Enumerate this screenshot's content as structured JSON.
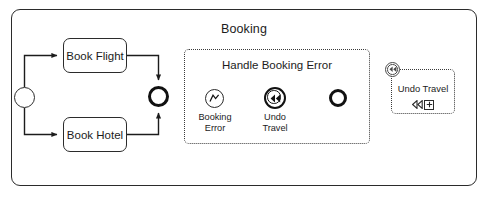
{
  "process": {
    "title": "Booking",
    "frame_style": "rounded-solid"
  },
  "tasks": [
    {
      "id": "book-flight",
      "label": "Book Flight"
    },
    {
      "id": "book-hotel",
      "label": "Book Hotel"
    }
  ],
  "events": [
    {
      "id": "start-event",
      "label": "",
      "kind": "start-event",
      "symbol": "none"
    },
    {
      "id": "merge-event",
      "label": "",
      "kind": "end-event",
      "symbol": "none"
    }
  ],
  "event_subprocess": {
    "title": "Handle Booking Error",
    "border": "dotted",
    "nodes": [
      {
        "id": "error-event",
        "label": "Booking\nError",
        "kind": "error-start-event",
        "symbol": "error-bolt-icon"
      },
      {
        "id": "compensation-event",
        "label": "Undo\nTravel",
        "kind": "compensation-throw-event",
        "symbol": "compensation-rewind-icon"
      },
      {
        "id": "sub-end-event",
        "label": "",
        "kind": "end-event",
        "symbol": "none"
      }
    ]
  },
  "compensation_task": {
    "label": "Undo Travel",
    "border": "dotted",
    "boundary_event": "compensation-boundary-icon",
    "markers": [
      "compensation-rewind-icon",
      "subprocess-expand-icon"
    ]
  },
  "colors": {
    "stroke": "#1c1c1c",
    "stroke_bold": "#111111",
    "dotted": "#3a3a3a",
    "background": "#ffffff"
  }
}
